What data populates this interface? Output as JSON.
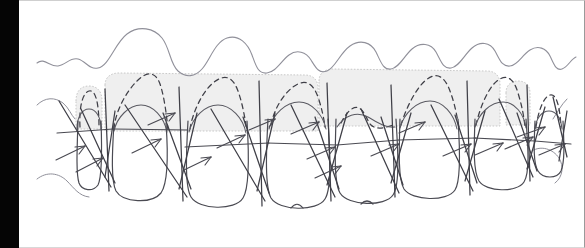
{
  "figure": {
    "title": "Periodontal anatomy line drawing",
    "view": "facial-frontal",
    "background_color": "#ffffff",
    "left_bar_color": "#050505",
    "ink_color": "#4a4a52",
    "light_ink_color": "#8f8f98",
    "shade_fill_color": "#efefef",
    "shade_stroke_color": "#c9c9c9",
    "dashed_ink_color": "#3f3f47"
  },
  "layers": [
    {
      "id": "mucogingival-line",
      "label": "Mucogingival / alveolar mucosa scalloped line",
      "style": "solid-thin-wavy",
      "color": "#8f8f98",
      "path": "M 18 105 C 26 99, 34 110, 44 108 C 54 106, 58 98, 66 100 C 74 102, 78 112, 88 110 C 100 108, 104 84, 114 72 C 124 60, 140 58, 152 66 C 164 74, 166 94, 174 104 C 182 114, 192 116, 200 108 C 208 100, 212 80, 224 74 C 236 68, 248 76, 254 88 C 260 100, 262 112, 272 112 C 282 112, 288 100, 296 94 C 304 88, 312 92, 318 100 C 324 108, 328 114, 336 110 C 344 106, 348 90, 358 82 C 368 74, 380 76, 386 86 C 392 96, 394 106, 402 106 C 410 106, 416 94, 424 86 C 432 78, 444 76, 452 84 C 460 92, 462 102, 470 102 C 478 102, 484 90, 492 82 C 500 74, 510 74, 516 82 C 522 90, 526 100, 534 98 C 542 96, 546 86, 552 84"
    },
    {
      "id": "alveolar-bone-crest-shading",
      "label": "Shaded alveolar bone / interdental septa blocks",
      "style": "filled-dotted-outline",
      "fill": "#efefef",
      "stroke": "#c9c9c9"
    },
    {
      "id": "bone-crest-dashed",
      "label": "Dashed alveolar crest outline over interdental papillae",
      "style": "dashed",
      "color": "#3f3f47"
    },
    {
      "id": "tooth-outlines",
      "label": "Tooth crown and root outlines",
      "style": "solid",
      "color": "#4a4a52"
    },
    {
      "id": "cej-lines",
      "label": "Cementoenamel junction horizontal reference lines",
      "style": "solid",
      "color": "#4a4a52"
    },
    {
      "id": "measurement-arrows",
      "label": "Probing depth / attachment level indicator arrows",
      "style": "arrowhead",
      "count": 16,
      "color": "#4a4a52"
    }
  ],
  "teeth": [
    {
      "name": "tooth-right-lateral-far",
      "index": 1,
      "type": "incisor"
    },
    {
      "name": "tooth-right-lateral",
      "index": 2,
      "type": "incisor"
    },
    {
      "name": "tooth-right-central",
      "index": 3,
      "type": "central-incisor"
    },
    {
      "name": "tooth-left-central",
      "index": 4,
      "type": "central-incisor"
    },
    {
      "name": "tooth-left-lateral",
      "index": 5,
      "type": "incisor"
    },
    {
      "name": "tooth-left-lateral-far",
      "index": 6,
      "type": "incisor"
    },
    {
      "name": "tooth-left-canine",
      "index": 7,
      "type": "canine"
    }
  ],
  "labels": {
    "none_visible": ""
  }
}
